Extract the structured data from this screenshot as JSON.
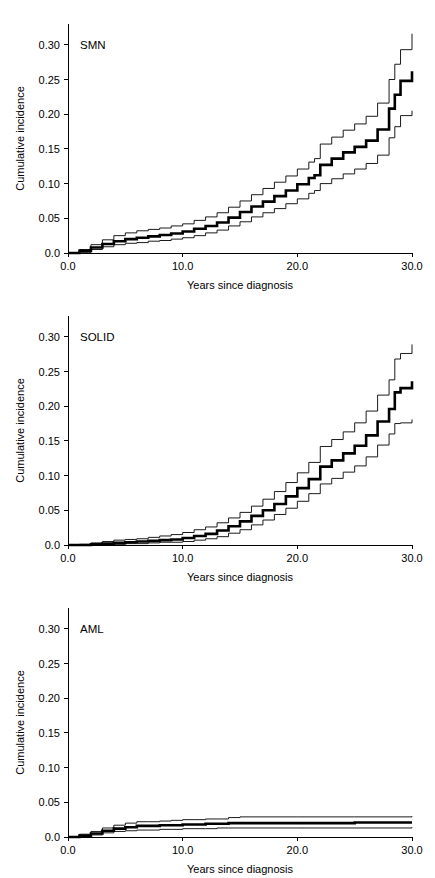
{
  "figure": {
    "background": "#ffffff",
    "line_color": "#000000",
    "panel_count": 3
  },
  "chart_data": [
    {
      "type": "line",
      "title": "SMN",
      "xlabel": "Years since diagnosis",
      "ylabel": "Cumulative incidence",
      "xlim": [
        0,
        30
      ],
      "ylim": [
        0,
        0.33
      ],
      "xticks": [
        0,
        10,
        20,
        30
      ],
      "xtick_labels": [
        "0.0",
        "10.0",
        "20.0",
        "30.0"
      ],
      "yticks": [
        0.0,
        0.05,
        0.1,
        0.15,
        0.2,
        0.25,
        0.3
      ],
      "ytick_labels": [
        "0.0",
        "0.05",
        "0.10",
        "0.15",
        "0.20",
        "0.25",
        "0.30"
      ],
      "grid": false,
      "legend": "none",
      "series": [
        {
          "name": "estimate",
          "style": "step-thick",
          "x": [
            0,
            1,
            2,
            3,
            4,
            5,
            6,
            7,
            8,
            9,
            10,
            11,
            12,
            13,
            14,
            15,
            16,
            17,
            18,
            19,
            20,
            21,
            21.5,
            22,
            23,
            24,
            25,
            26,
            27,
            28,
            28.5,
            29,
            30
          ],
          "y": [
            0.0,
            0.003,
            0.008,
            0.013,
            0.017,
            0.02,
            0.022,
            0.024,
            0.026,
            0.028,
            0.031,
            0.035,
            0.039,
            0.044,
            0.051,
            0.059,
            0.067,
            0.074,
            0.082,
            0.09,
            0.099,
            0.108,
            0.112,
            0.127,
            0.136,
            0.145,
            0.153,
            0.162,
            0.178,
            0.208,
            0.228,
            0.248,
            0.262
          ]
        },
        {
          "name": "upper-95ci",
          "style": "step-thin",
          "x": [
            0,
            1,
            2,
            3,
            4,
            5,
            6,
            7,
            8,
            9,
            10,
            11,
            12,
            13,
            14,
            15,
            16,
            17,
            18,
            19,
            20,
            21,
            21.5,
            22,
            23,
            24,
            25,
            26,
            27,
            28,
            28.5,
            29,
            30
          ],
          "y": [
            0.0,
            0.005,
            0.012,
            0.019,
            0.025,
            0.029,
            0.032,
            0.034,
            0.036,
            0.039,
            0.042,
            0.047,
            0.052,
            0.058,
            0.066,
            0.075,
            0.084,
            0.093,
            0.102,
            0.111,
            0.121,
            0.131,
            0.136,
            0.157,
            0.167,
            0.177,
            0.186,
            0.197,
            0.216,
            0.25,
            0.272,
            0.293,
            0.316
          ]
        },
        {
          "name": "lower-95ci",
          "style": "step-thin",
          "x": [
            0,
            1,
            2,
            3,
            4,
            5,
            6,
            7,
            8,
            9,
            10,
            11,
            12,
            13,
            14,
            15,
            16,
            17,
            18,
            19,
            20,
            21,
            21.5,
            22,
            23,
            24,
            25,
            26,
            27,
            28,
            28.5,
            29,
            30
          ],
          "y": [
            0.0,
            0.001,
            0.005,
            0.009,
            0.012,
            0.014,
            0.015,
            0.017,
            0.018,
            0.02,
            0.022,
            0.025,
            0.029,
            0.033,
            0.039,
            0.045,
            0.052,
            0.058,
            0.064,
            0.071,
            0.078,
            0.086,
            0.09,
            0.1,
            0.107,
            0.114,
            0.121,
            0.129,
            0.141,
            0.166,
            0.182,
            0.198,
            0.205
          ]
        }
      ]
    },
    {
      "type": "line",
      "title": "SOLID",
      "xlabel": "Years since diagnosis",
      "ylabel": "Cumulative incidence",
      "xlim": [
        0,
        30
      ],
      "ylim": [
        0,
        0.33
      ],
      "xticks": [
        0,
        10,
        20,
        30
      ],
      "xtick_labels": [
        "0.0",
        "10.0",
        "20.0",
        "30.0"
      ],
      "yticks": [
        0.0,
        0.05,
        0.1,
        0.15,
        0.2,
        0.25,
        0.3
      ],
      "ytick_labels": [
        "0.0",
        "0.05",
        "0.10",
        "0.15",
        "0.20",
        "0.25",
        "0.30"
      ],
      "grid": false,
      "legend": "none",
      "series": [
        {
          "name": "estimate",
          "style": "step-thick",
          "x": [
            0,
            1,
            2,
            3,
            4,
            5,
            6,
            7,
            8,
            9,
            10,
            11,
            12,
            13,
            14,
            15,
            16,
            17,
            18,
            19,
            20,
            21,
            22,
            23,
            24,
            25,
            26,
            27,
            28,
            28.5,
            29,
            30
          ],
          "y": [
            0.0,
            0.0,
            0.001,
            0.002,
            0.003,
            0.004,
            0.005,
            0.006,
            0.007,
            0.008,
            0.01,
            0.013,
            0.016,
            0.021,
            0.027,
            0.034,
            0.042,
            0.05,
            0.059,
            0.07,
            0.082,
            0.095,
            0.113,
            0.122,
            0.132,
            0.143,
            0.158,
            0.178,
            0.196,
            0.22,
            0.226,
            0.236
          ]
        },
        {
          "name": "upper-95ci",
          "style": "step-thin",
          "x": [
            0,
            1,
            2,
            3,
            4,
            5,
            6,
            7,
            8,
            9,
            10,
            11,
            12,
            13,
            14,
            15,
            16,
            17,
            18,
            19,
            20,
            21,
            22,
            23,
            24,
            25,
            26,
            27,
            28,
            28.5,
            29,
            30
          ],
          "y": [
            0.0,
            0.001,
            0.003,
            0.005,
            0.007,
            0.008,
            0.009,
            0.011,
            0.013,
            0.015,
            0.018,
            0.022,
            0.026,
            0.032,
            0.039,
            0.047,
            0.056,
            0.066,
            0.077,
            0.09,
            0.104,
            0.119,
            0.142,
            0.152,
            0.163,
            0.176,
            0.193,
            0.216,
            0.238,
            0.268,
            0.276,
            0.289
          ]
        },
        {
          "name": "lower-95ci",
          "style": "step-thin",
          "x": [
            0,
            1,
            2,
            3,
            4,
            5,
            6,
            7,
            8,
            9,
            10,
            11,
            12,
            13,
            14,
            15,
            16,
            17,
            18,
            19,
            20,
            21,
            22,
            23,
            24,
            25,
            26,
            27,
            28,
            28.5,
            29,
            30
          ],
          "y": [
            0.0,
            0.0,
            0.0,
            0.001,
            0.001,
            0.002,
            0.002,
            0.003,
            0.004,
            0.004,
            0.005,
            0.007,
            0.009,
            0.012,
            0.017,
            0.022,
            0.029,
            0.036,
            0.044,
            0.053,
            0.063,
            0.074,
            0.088,
            0.096,
            0.105,
            0.114,
            0.127,
            0.144,
            0.16,
            0.175,
            0.176,
            0.181
          ]
        }
      ]
    },
    {
      "type": "line",
      "title": "AML",
      "xlabel": "Years since diagnosis",
      "ylabel": "Cumulative incidence",
      "xlim": [
        0,
        30
      ],
      "ylim": [
        0,
        0.33
      ],
      "xticks": [
        0,
        10,
        20,
        30
      ],
      "xtick_labels": [
        "0.0",
        "10.0",
        "20.0",
        "30.0"
      ],
      "yticks": [
        0.0,
        0.05,
        0.1,
        0.15,
        0.2,
        0.25,
        0.3
      ],
      "ytick_labels": [
        "0.0",
        "0.05",
        "0.10",
        "0.15",
        "0.20",
        "0.25",
        "0.30"
      ],
      "grid": false,
      "legend": "none",
      "series": [
        {
          "name": "estimate",
          "style": "step-thick",
          "x": [
            0,
            1,
            2,
            3,
            4,
            5,
            6,
            7,
            8,
            9,
            10,
            11,
            12,
            13,
            14,
            15,
            20,
            25,
            30
          ],
          "y": [
            0.0,
            0.002,
            0.005,
            0.009,
            0.012,
            0.014,
            0.016,
            0.016,
            0.017,
            0.017,
            0.018,
            0.018,
            0.019,
            0.019,
            0.02,
            0.02,
            0.02,
            0.021,
            0.021
          ]
        },
        {
          "name": "upper-95ci",
          "style": "step-thin",
          "x": [
            0,
            1,
            2,
            3,
            4,
            5,
            6,
            7,
            8,
            9,
            10,
            11,
            12,
            13,
            14,
            15,
            20,
            25,
            30
          ],
          "y": [
            0.0,
            0.004,
            0.008,
            0.013,
            0.017,
            0.02,
            0.022,
            0.022,
            0.023,
            0.024,
            0.025,
            0.025,
            0.026,
            0.026,
            0.028,
            0.029,
            0.029,
            0.029,
            0.03
          ]
        },
        {
          "name": "lower-95ci",
          "style": "step-thin",
          "x": [
            0,
            1,
            2,
            3,
            4,
            5,
            6,
            7,
            8,
            9,
            10,
            11,
            12,
            13,
            14,
            15,
            20,
            25,
            30
          ],
          "y": [
            0.0,
            0.001,
            0.003,
            0.006,
            0.008,
            0.009,
            0.01,
            0.01,
            0.011,
            0.011,
            0.012,
            0.012,
            0.012,
            0.013,
            0.013,
            0.013,
            0.013,
            0.013,
            0.014
          ]
        }
      ]
    }
  ]
}
